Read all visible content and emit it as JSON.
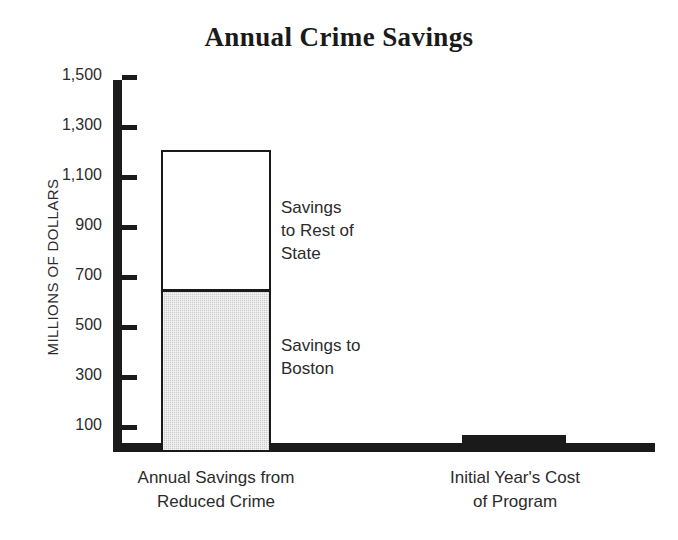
{
  "chart_data": {
    "type": "bar",
    "title": "Annual Crime Savings",
    "xlabel": "",
    "ylabel": "MILLIONS OF DOLLARS",
    "stacked": true,
    "grid": false,
    "legend": "annotations-inline",
    "ylim": [
      0,
      1500
    ],
    "yticks": [
      100,
      300,
      500,
      700,
      900,
      1100,
      1300,
      1500
    ],
    "ytick_labels": [
      "100",
      "300",
      "500",
      "700",
      "900",
      "1,100",
      "1,300",
      "1,500"
    ],
    "categories": [
      "Annual Savings from\nReduced Crime",
      "Initial Year's Cost\nof Program"
    ],
    "series": [
      {
        "name": "Savings to Boston",
        "values": [
          650,
          0
        ],
        "fill": "gray-stipple"
      },
      {
        "name": "Savings to Rest of State",
        "values": [
          560,
          0
        ],
        "fill": "white"
      },
      {
        "name": "Initial Year's Cost of Program",
        "values": [
          0,
          68
        ],
        "fill": "black"
      }
    ],
    "totals": [
      1210,
      68
    ],
    "annotations": [
      {
        "id": "rest-of-state",
        "text": "Savings\nto Rest of\nState"
      },
      {
        "id": "boston",
        "text": "Savings to\nBoston"
      }
    ]
  },
  "axis": {
    "tick_labels": [
      "1,500",
      "1,300",
      "1,100",
      "900",
      "700",
      "500",
      "300",
      "100"
    ],
    "y_title": "MILLIONS OF DOLLARS"
  },
  "colors": {
    "ink": "#1a1a1a",
    "gray_fill": "#cdcdcd",
    "white_fill": "#ffffff",
    "background": "#ffffff"
  }
}
